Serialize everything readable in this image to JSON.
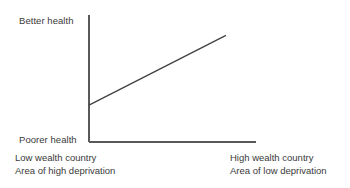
{
  "chart_data": {
    "type": "line",
    "title": "",
    "xlabel": "",
    "ylabel": "",
    "grid": false,
    "legend": null,
    "axis_color": "#595959",
    "line_color": "#404040",
    "background": "#ffffff",
    "text_color": "#3a3a3a",
    "y_axis_ticks": [
      "Poorer health",
      "Better health"
    ],
    "x_axis_ticks": [
      "Low wealth country / Area of high deprivation",
      "High wealth country / Area of low deprivation"
    ],
    "xlim": [
      0,
      1
    ],
    "ylim": [
      0,
      1
    ],
    "series": [
      {
        "name": "health gradient",
        "x": [
          0.0,
          0.82
        ],
        "y": [
          0.29,
          0.84
        ]
      }
    ],
    "annotations": []
  },
  "axis_labels": {
    "y_top": "Better health",
    "y_bottom": "Poorer health"
  },
  "captions": {
    "left": {
      "line1": "Low wealth country",
      "line2": "Area of high deprivation"
    },
    "right": {
      "line1": "High wealth country",
      "line2": "Area of low deprivation"
    }
  },
  "geometry": {
    "y_axis_x": 89,
    "y_axis_top": 15,
    "y_axis_bottom": 142,
    "x_axis_right": 256,
    "trend_start_x": 89,
    "trend_start_y": 105,
    "trend_end_x": 226,
    "trend_end_y": 35
  }
}
